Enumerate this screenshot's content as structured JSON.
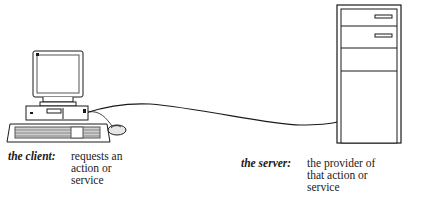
{
  "diagram": {
    "type": "client-server",
    "nodes": [
      {
        "id": "client",
        "icon": "desktop-computer-icon"
      },
      {
        "id": "server",
        "icon": "tower-server-icon"
      }
    ],
    "edges": [
      {
        "from": "client",
        "to": "server",
        "style": "cable-line"
      }
    ]
  },
  "client": {
    "term": "the client:",
    "desc_lines": [
      "requests an",
      "action or",
      "service"
    ]
  },
  "server": {
    "term": "the server:",
    "desc_lines": [
      "the provider of",
      "that action or",
      "service"
    ]
  },
  "colors": {
    "line": "#1a1a1a",
    "background": "#ffffff",
    "shade": "#9a9a9a"
  }
}
